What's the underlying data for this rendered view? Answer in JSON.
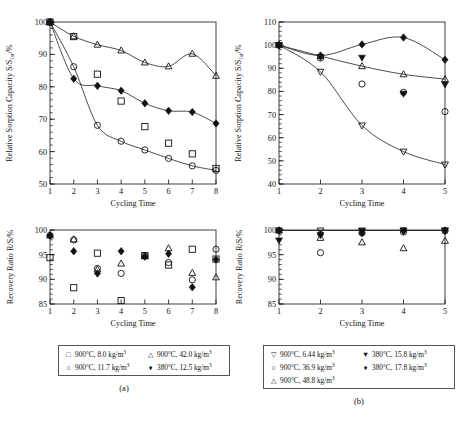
{
  "figure": {
    "panel_a_label": "(a)",
    "panel_b_label": "(b)"
  },
  "axis_text": {
    "sorption_y_prefix": "Relative Sorption Capacity S/S",
    "sorption_y_sub": "1st",
    "sorption_y_suffix": "/%",
    "recovery_y": "Recovery Ratio R/S/%",
    "x_label": "Cycling Time"
  },
  "legend_a": {
    "rows": [
      [
        {
          "symbol": "open-square",
          "text_prefix": "900°C, 8.0 kg/m",
          "text_sup": "3"
        },
        {
          "symbol": "open-triangle-up",
          "text_prefix": "900°C, 42.0 kg/m",
          "text_sup": "3"
        }
      ],
      [
        {
          "symbol": "open-circle",
          "text_prefix": "900°C, 11.7 kg/m",
          "text_sup": "3"
        },
        {
          "symbol": "filled-diamond",
          "text_prefix": "380°C, 12.5 kg/m",
          "text_sup": "3"
        }
      ]
    ]
  },
  "legend_b": {
    "rows": [
      [
        {
          "symbol": "open-triangle-down",
          "text_prefix": "900°C, 6.44 kg/m",
          "text_sup": "3"
        },
        {
          "symbol": "filled-triangle-down",
          "text_prefix": "380°C, 15.8 kg/m",
          "text_sup": "3"
        }
      ],
      [
        {
          "symbol": "open-circle",
          "text_prefix": "900°C, 36.9 kg/m",
          "text_sup": "3"
        },
        {
          "symbol": "filled-diamond",
          "text_prefix": "380°C, 17.8 kg/m",
          "text_sup": "3"
        }
      ],
      [
        {
          "symbol": "open-triangle-up",
          "text_prefix": "900°C, 48.8 kg/m",
          "text_sup": "3"
        },
        {
          "symbol": "",
          "text_prefix": "",
          "text_sup": ""
        }
      ]
    ]
  },
  "chart_data": [
    {
      "id": "a-top",
      "type": "scatter",
      "title": "",
      "xlabel": "Cycling Time",
      "ylabel": "Relative Sorption Capacity S/S1st/%",
      "xlim": [
        1,
        8
      ],
      "ylim": [
        50,
        100
      ],
      "xticks": [
        1,
        2,
        3,
        4,
        5,
        6,
        7,
        8
      ],
      "yticks": [
        50,
        60,
        70,
        80,
        90,
        100
      ],
      "grid": false,
      "legend_position": "below-figure",
      "series": [
        {
          "name": "900°C, 8.0 kg/m3",
          "marker": "open-square",
          "x": [
            1,
            2,
            3,
            4,
            5,
            6,
            7,
            8
          ],
          "values": [
            100,
            95.5,
            83.9,
            75.6,
            67.7,
            62.6,
            59.3,
            54.8
          ],
          "fit_curve": false
        },
        {
          "name": "900°C, 11.7 kg/m3",
          "marker": "open-circle",
          "x": [
            1,
            2,
            3,
            4,
            5,
            6,
            7,
            8
          ],
          "values": [
            100,
            86.2,
            68.1,
            63.2,
            60.5,
            57.9,
            55.6,
            54.2
          ],
          "fit_curve": true
        },
        {
          "name": "900°C, 42.0 kg/m3",
          "marker": "open-triangle-up",
          "x": [
            1,
            2,
            3,
            4,
            5,
            6,
            7,
            8
          ],
          "values": [
            100,
            95.6,
            93.0,
            91.2,
            87.5,
            86.3,
            90.2,
            83.4
          ],
          "fit_curve": true
        },
        {
          "name": "380°C, 12.5 kg/m3",
          "marker": "filled-diamond",
          "x": [
            1,
            2,
            3,
            4,
            5,
            6,
            7,
            8
          ],
          "values": [
            100,
            82.5,
            80.3,
            78.8,
            74.9,
            72.6,
            72.2,
            68.7
          ],
          "fit_curve": true
        }
      ]
    },
    {
      "id": "b-top",
      "type": "scatter",
      "title": "",
      "xlabel": "Cycling Time",
      "ylabel": "Relative Sorption Capacity S/S1st/%",
      "xlim": [
        1,
        5
      ],
      "ylim": [
        40,
        110
      ],
      "xticks": [
        1,
        2,
        3,
        4,
        5
      ],
      "yticks": [
        40,
        50,
        60,
        70,
        80,
        90,
        100,
        110
      ],
      "grid": false,
      "legend_position": "below-figure",
      "series": [
        {
          "name": "900°C, 6.44 kg/m3",
          "marker": "open-triangle-down",
          "x": [
            1,
            2,
            3,
            4,
            5
          ],
          "values": [
            100,
            88.5,
            65.3,
            54.0,
            48.4
          ],
          "fit_curve": true
        },
        {
          "name": "900°C, 36.9 kg/m3",
          "marker": "open-circle",
          "x": [
            1,
            2,
            3,
            4,
            5
          ],
          "values": [
            100,
            94.4,
            83.2,
            79.6,
            71.3
          ],
          "fit_curve": false
        },
        {
          "name": "900°C, 48.8 kg/m3",
          "marker": "open-triangle-up",
          "x": [
            1,
            2,
            3,
            4,
            5
          ],
          "values": [
            100,
            95.3,
            90.9,
            87.4,
            85.3
          ],
          "fit_curve": true
        },
        {
          "name": "380°C, 15.8 kg/m3",
          "marker": "filled-triangle-down",
          "x": [
            1,
            2,
            3,
            4,
            5
          ],
          "values": [
            100,
            94.9,
            94.6,
            79.0,
            83.0
          ],
          "fit_curve": false
        },
        {
          "name": "380°C, 17.8 kg/m3",
          "marker": "filled-diamond",
          "x": [
            1,
            2,
            3,
            4,
            5
          ],
          "values": [
            100,
            95.5,
            100.3,
            103.3,
            93.7
          ],
          "fit_curve": true
        }
      ]
    },
    {
      "id": "a-bottom",
      "type": "scatter",
      "title": "",
      "xlabel": "Cycling Time",
      "ylabel": "Recovery Ratio R/S/%",
      "xlim": [
        1,
        8
      ],
      "ylim": [
        85,
        100
      ],
      "xticks": [
        1,
        2,
        3,
        4,
        5,
        6,
        7,
        8
      ],
      "yticks": [
        85,
        90,
        95,
        100
      ],
      "grid": false,
      "legend_position": "below-figure",
      "series": [
        {
          "name": "900°C, 8.0 kg/m3",
          "marker": "open-square",
          "x": [
            1,
            2,
            3,
            4,
            5,
            6,
            7,
            8
          ],
          "values": [
            94.4,
            88.3,
            95.3,
            85.7,
            94.8,
            92.9,
            96.1,
            94.1
          ]
        },
        {
          "name": "900°C, 11.7 kg/m3",
          "marker": "open-circle",
          "x": [
            1,
            2,
            3,
            4,
            5,
            6,
            7,
            8
          ],
          "values": [
            98.9,
            98.0,
            92.2,
            91.2,
            94.8,
            93.4,
            89.9,
            96.1
          ]
        },
        {
          "name": "900°C, 42.0 kg/m3",
          "marker": "open-triangle-up",
          "x": [
            1,
            2,
            3,
            4,
            5,
            6,
            7,
            8
          ],
          "values": [
            98.9,
            98.1,
            92.0,
            93.2,
            94.7,
            96.3,
            91.3,
            90.4
          ]
        },
        {
          "name": "380°C, 12.5 kg/m3",
          "marker": "filled-diamond",
          "x": [
            1,
            2,
            3,
            4,
            5,
            6,
            7,
            8
          ],
          "values": [
            98.9,
            95.7,
            91.2,
            95.7,
            94.6,
            95.2,
            88.4,
            94.0
          ]
        }
      ]
    },
    {
      "id": "b-bottom",
      "type": "scatter",
      "title": "",
      "xlabel": "Cycling Time",
      "ylabel": "Recovery Ratio R/S/%",
      "xlim": [
        1,
        5
      ],
      "ylim": [
        85,
        100
      ],
      "xticks": [
        1,
        2,
        3,
        4,
        5
      ],
      "yticks": [
        85,
        90,
        95,
        100
      ],
      "grid": false,
      "legend_position": "below-figure",
      "series": [
        {
          "name": "900°C, 6.44 kg/m3",
          "marker": "open-triangle-down",
          "x": [
            1,
            2,
            3,
            4,
            5
          ],
          "values": [
            99.9,
            99.9,
            99.9,
            99.9,
            99.9
          ]
        },
        {
          "name": "900°C, 36.9 kg/m3",
          "marker": "open-circle",
          "x": [
            1,
            2,
            3,
            4,
            5
          ],
          "values": [
            99.9,
            95.4,
            99.4,
            99.6,
            99.8
          ]
        },
        {
          "name": "900°C, 48.8 kg/m3",
          "marker": "open-triangle-up",
          "x": [
            1,
            2,
            3,
            4,
            5
          ],
          "values": [
            99.9,
            98.4,
            97.5,
            96.3,
            97.8
          ]
        },
        {
          "name": "380°C, 15.8 kg/m3",
          "marker": "filled-triangle-down",
          "x": [
            1,
            2,
            3,
            4,
            5
          ],
          "values": [
            97.9,
            99.0,
            99.8,
            99.9,
            99.9
          ]
        },
        {
          "name": "380°C, 17.8 kg/m3",
          "marker": "filled-diamond",
          "x": [
            1,
            2,
            3,
            4,
            5
          ],
          "values": [
            99.9,
            99.1,
            99.4,
            99.8,
            99.9
          ]
        }
      ]
    }
  ]
}
